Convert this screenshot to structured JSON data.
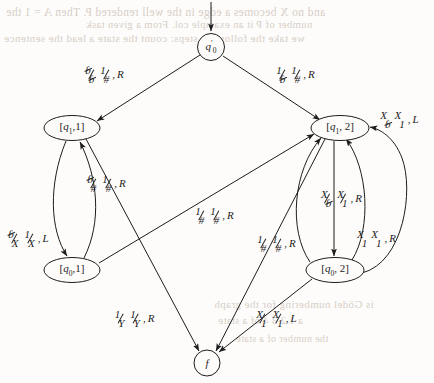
{
  "figure": {
    "kind": "turing-machine-state-diagram",
    "ink_color": "#1d1d1d",
    "page_color": "#fdfcfa",
    "bleed_color": "#b9a99c"
  },
  "nodes": [
    {
      "id": "q0prime",
      "label_html": "<i>q</i><sub>0</sub>",
      "prime": true,
      "shape": "circle",
      "cx": 211,
      "cy": 47,
      "rx": 13.5,
      "ry": 13.5
    },
    {
      "id": "q1_1",
      "label_html": "[<i>q</i><sub>1</sub>,1]",
      "shape": "ellipse",
      "cx": 72,
      "cy": 128,
      "rx": 28,
      "ry": 12.5
    },
    {
      "id": "q1_2",
      "label_html": "[<i>q</i><sub>1</sub>, 2]",
      "shape": "ellipse",
      "cx": 340,
      "cy": 128,
      "rx": 29,
      "ry": 12.5
    },
    {
      "id": "q0_1",
      "label_html": "[<i>q</i><sub>0</sub>,1]",
      "shape": "ellipse",
      "cx": 72,
      "cy": 270,
      "rx": 28,
      "ry": 12.5
    },
    {
      "id": "q0_2",
      "label_html": "[<i>q</i><sub>0</sub>, 2]",
      "shape": "ellipse",
      "cx": 335,
      "cy": 270,
      "rx": 29,
      "ry": 12.5
    },
    {
      "id": "f",
      "label_html": "<i>f</i>",
      "shape": "circle",
      "cx": 207,
      "cy": 363,
      "rx": 13,
      "ry": 13
    }
  ],
  "start_arrow": {
    "from_x": 211,
    "from_y": 2,
    "to_x": 211,
    "to_y": 33
  },
  "transitions": [
    {
      "id": "t1",
      "from": "q0prime",
      "to": "q1_1",
      "label": {
        "x": 104,
        "y": 74,
        "parts": [
          {
            "num": "ɓ",
            "den": "ɓ",
            "bar": true,
            "blank_num": true,
            "blank_den": true
          },
          {
            "num": "1",
            "den": "#",
            "bar": true
          },
          {
            "dir": "R"
          }
        ]
      }
    },
    {
      "id": "t2",
      "from": "q0prime",
      "to": "q1_2",
      "label": {
        "x": 295,
        "y": 74,
        "parts": [
          {
            "num": "1",
            "den": "ɓ",
            "bar": true,
            "blank_den": true
          },
          {
            "num": "1",
            "den": "#",
            "bar": true
          },
          {
            "dir": "R"
          }
        ]
      }
    },
    {
      "id": "t3",
      "from": "q1_1",
      "to": "q0_1",
      "label": {
        "x": 28,
        "y": 238,
        "parts": [
          {
            "num": "ɓ",
            "den": "X",
            "bar": true,
            "blank_num": true
          },
          {
            "num": "1",
            "den": "X",
            "bar": true
          },
          {
            "dir": "L"
          }
        ]
      }
    },
    {
      "id": "t4",
      "from": "q0_1",
      "to": "q1_1",
      "label": {
        "x": 106,
        "y": 183,
        "parts": [
          {
            "num": "ɓ",
            "den": "#",
            "bar": true,
            "blank_num": true
          },
          {
            "num": "1",
            "den": "#",
            "bar": true
          },
          {
            "dir": "R"
          }
        ]
      }
    },
    {
      "id": "t5",
      "from": "q1_1",
      "to": "f",
      "label": {
        "x": 134,
        "y": 318,
        "parts": [
          {
            "num": "1",
            "den": "Y",
            "bar": true
          },
          {
            "num": "1",
            "den": "Y",
            "bar": true
          },
          {
            "dir": "R"
          }
        ]
      }
    },
    {
      "id": "t6",
      "from": "q0_1",
      "to": "q1_2",
      "label": {
        "x": 214,
        "y": 215,
        "parts": [
          {
            "num": "1",
            "den": "#",
            "bar": true
          },
          {
            "num": "1",
            "den": "#",
            "bar": true
          },
          {
            "dir": "R"
          }
        ]
      }
    },
    {
      "id": "t7",
      "from": "q1_2",
      "to": "f",
      "label": {
        "x": 276,
        "y": 243,
        "parts": [
          {
            "num": "1",
            "den": "#",
            "bar": true
          },
          {
            "num": "1",
            "den": "#",
            "bar": true
          },
          {
            "dir": "R"
          }
        ]
      }
    },
    {
      "id": "t8",
      "from": "q0_2",
      "to": "f",
      "label": {
        "x": 276,
        "y": 318,
        "parts": [
          {
            "num": "X",
            "den": "1",
            "bar": true
          },
          {
            "num": "X",
            "den": "1",
            "bar": true
          },
          {
            "dir": "L"
          }
        ]
      }
    },
    {
      "id": "t9",
      "from": "q0_2",
      "to": "q1_2",
      "label": {
        "x": 399,
        "y": 119,
        "parts": [
          {
            "num": "X",
            "den": "ɓ",
            "bar": false,
            "blank_den": true
          },
          {
            "num": "X",
            "den": "1",
            "bar": false
          },
          {
            "dir": "L"
          }
        ]
      }
    },
    {
      "id": "t10",
      "from": "q1_2",
      "to": "q0_2",
      "label": {
        "x": 341,
        "y": 198,
        "parts": [
          {
            "num": "X",
            "den": "ɓ",
            "bar": true,
            "blank_den": true
          },
          {
            "num": "X",
            "den": "1",
            "bar": true
          },
          {
            "dir": "R"
          }
        ]
      }
    },
    {
      "id": "t11",
      "from": "q0_2",
      "to": "q1_2",
      "label": {
        "x": 376,
        "y": 238,
        "parts": [
          {
            "num": "X",
            "den": "1",
            "bar": false
          },
          {
            "num": "X",
            "den": "1",
            "bar": false
          },
          {
            "dir": "R"
          }
        ]
      }
    }
  ],
  "bleed_text": {
    "line1": "and no X becomes a edge in the well rendered P. Then A = 1 the",
    "line2": "number of P it an example col. From a given task",
    "line3": "we take the following steps: count the state  a lead    the  sentence",
    "line4": "is Gödel numbering for the graph",
    "line5": "a      1  2    3   4   of a    state",
    "line6": "the number of a state"
  }
}
